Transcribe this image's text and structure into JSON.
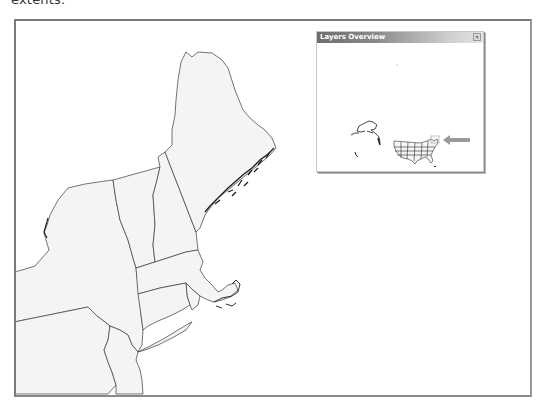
{
  "caption": {
    "text": "extents."
  },
  "map": {
    "region": "Northeastern United States",
    "states_visible": [
      "Maine",
      "New Hampshire",
      "Vermont",
      "Massachusetts",
      "Rhode Island",
      "Connecticut",
      "New York",
      "New Jersey",
      "Pennsylvania"
    ],
    "land_fill": "#f4f4f4",
    "water_fill": "#ffffff",
    "border_color": "#3a3a3a",
    "frame_color": "#7a7a7a"
  },
  "overview": {
    "title": "Layers Overview",
    "close_glyph": "×",
    "extent_box_color": "#b0b0b0",
    "arrow_color": "#9a9a9a",
    "title_gradient": [
      "#6d6d6d",
      "#e4e4e4"
    ]
  }
}
